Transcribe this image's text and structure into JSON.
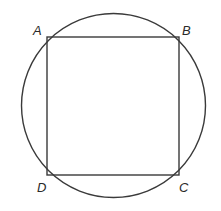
{
  "diagram": {
    "vertices": [
      {
        "id": "A",
        "label": "A",
        "position": "top-left"
      },
      {
        "id": "B",
        "label": "B",
        "position": "top-right"
      },
      {
        "id": "C",
        "label": "C",
        "position": "bottom-right"
      },
      {
        "id": "D",
        "label": "D",
        "position": "bottom-left"
      }
    ],
    "shapes": [
      "circle",
      "square"
    ],
    "stroke_color": "#3a3a3a"
  }
}
